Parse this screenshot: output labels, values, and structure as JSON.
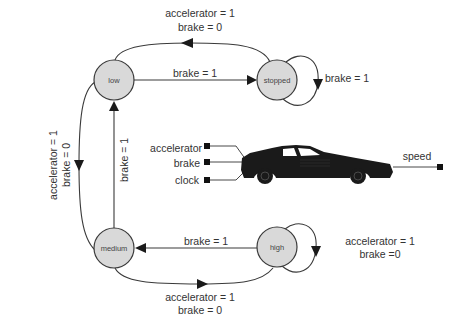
{
  "diagram": {
    "type": "state-machine",
    "nodes": {
      "low": "low",
      "stopped": "stopped",
      "medium": "medium",
      "high": "high"
    },
    "colors": {
      "node_fill": "#d9d9d9",
      "line": "#3a3a3a",
      "car": "#1a1a1a"
    },
    "edges": [
      {
        "from": "stopped",
        "to": "low",
        "label_line1": "accelerator = 1",
        "label_line2": "brake = 0"
      },
      {
        "from": "low",
        "to": "stopped",
        "label": "brake = 1"
      },
      {
        "from": "stopped",
        "to": "stopped",
        "label": "brake = 1"
      },
      {
        "from": "low",
        "to": "medium",
        "label_line1": "accelerator = 1",
        "label_line2": "brake = 0"
      },
      {
        "from": "medium",
        "to": "low",
        "label": "brake = 1"
      },
      {
        "from": "high",
        "to": "medium",
        "label": "brake = 1"
      },
      {
        "from": "medium",
        "to": "high",
        "label_line1": "accelerator = 1",
        "label_line2": "brake = 0"
      },
      {
        "from": "high",
        "to": "high",
        "label_line1": "accelerator = 1",
        "label_line2": "brake =0"
      }
    ],
    "block": {
      "inputs": [
        "accelerator",
        "brake",
        "clock"
      ],
      "output": "speed",
      "icon": "car-icon"
    }
  }
}
